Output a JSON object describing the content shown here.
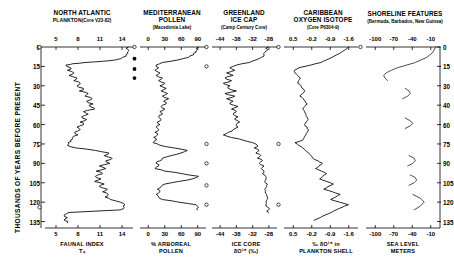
{
  "figure": {
    "yaxis": {
      "label": "THOUSANDS OF YEARS BEFORE PRESENT",
      "ticks": [
        0,
        15,
        30,
        45,
        60,
        75,
        90,
        105,
        120,
        135
      ],
      "right_ticks": [
        0,
        15,
        30,
        40,
        60,
        75,
        90,
        105,
        120,
        135
      ],
      "min": 0,
      "max": 140
    },
    "panels": [
      {
        "title": "NORTH ATLANTIC",
        "title2": "PLANKTON",
        "source": "(Core V23-82)",
        "xticks": [
          "5",
          "8",
          "11",
          "14"
        ],
        "xlabel1": "FAUNAL INDEX",
        "xlabel2": "Tₛ",
        "xmin": 4.2,
        "xmax": 15.2
      },
      {
        "title": "MEDITERRANEAN",
        "title2": "POLLEN",
        "source": "(Macedonia Lake)",
        "xticks": [
          "0",
          "30",
          "60",
          "90"
        ],
        "xlabel1": "% ARBOREAL",
        "xlabel2": "POLLEN",
        "xmin": -6,
        "xmax": 100
      },
      {
        "title": "GREENLAND",
        "title2": "ICE CAP",
        "source": "(Camp Century Core)",
        "xticks": [
          "-44",
          "-38",
          "-32",
          "-28"
        ],
        "xlabel1": "ICE CORE",
        "xlabel2": "δO¹⁸ (‰)",
        "xmin": -46,
        "xmax": -26
      },
      {
        "title": "CARIBBEAN",
        "title2": "OXYGEN ISOTOPE",
        "source": "(Core P6304-9)",
        "xticks": [
          "0.5",
          "-0.2",
          "-0.9",
          "-1.6"
        ],
        "xlabel1": "‰ δO¹⁸ in",
        "xlabel2": "PLANKTON SHELL",
        "xmin": 0.8,
        "xmax": -1.9
      },
      {
        "title": "SHORELINE FEATURES",
        "title2": "",
        "source": "(Bermuda, Barbados, New Guinea)",
        "xticks": [
          "-100",
          "-70",
          "-40",
          "-10"
        ],
        "xlabel1": "SEA LEVEL",
        "xlabel2": "METERS",
        "xmin": -112,
        "xmax": 5
      }
    ]
  },
  "chart_data": {
    "type": "line",
    "ylabel": "THOUSANDS OF YEARS BEFORE PRESENT",
    "ylim": [
      0,
      140
    ],
    "grid": false,
    "legend": "none",
    "series": [
      {
        "name": "North Atlantic Plankton Faunal Index Ts (Core V23-82)",
        "xlabel": "FAUNAL INDEX Ts",
        "xlim": [
          4.2,
          15.2
        ],
        "xticks": [
          5,
          8,
          11,
          14
        ],
        "age_kyr": [
          0,
          2,
          4,
          6,
          8,
          10,
          11,
          12,
          13,
          14,
          16,
          18,
          20,
          22,
          24,
          26,
          28,
          30,
          32,
          34,
          36,
          38,
          40,
          42,
          44,
          46,
          48,
          50,
          52,
          54,
          56,
          58,
          60,
          62,
          64,
          66,
          68,
          70,
          72,
          74,
          76,
          78,
          80,
          82,
          84,
          86,
          88,
          90,
          92,
          94,
          96,
          98,
          100,
          102,
          104,
          106,
          108,
          110,
          112,
          114,
          116,
          118,
          120,
          122,
          124,
          126,
          128,
          130,
          132,
          134,
          136
        ],
        "values": [
          14.6,
          14.6,
          14.5,
          14.3,
          13.9,
          13.0,
          11.5,
          9.2,
          7.6,
          6.8,
          7.4,
          7.0,
          7.8,
          7.2,
          8.2,
          7.8,
          8.6,
          8.2,
          9.0,
          8.5,
          9.6,
          9.2,
          10.1,
          9.4,
          10.2,
          9.8,
          10.4,
          9.0,
          9.6,
          8.8,
          9.4,
          8.6,
          9.0,
          8.2,
          8.6,
          7.9,
          8.3,
          7.6,
          7.4,
          7.1,
          7.0,
          8.0,
          10.5,
          12.2,
          11.6,
          12.6,
          11.8,
          12.3,
          11.0,
          11.8,
          10.6,
          11.4,
          10.5,
          11.2,
          10.4,
          11.6,
          11.0,
          12.0,
          11.4,
          12.1,
          11.7,
          12.4,
          13.6,
          14.2,
          14.1,
          13.6,
          7.2,
          6.6,
          7.0,
          6.6,
          7.0
        ]
      },
      {
        "name": "Mediterranean Arboreal Pollen (Macedonia Lake)",
        "xlabel": "% ARBOREAL POLLEN",
        "xlim": [
          -6,
          100
        ],
        "xticks": [
          0,
          30,
          60,
          90
        ],
        "age_kyr": [
          0,
          2,
          4,
          6,
          8,
          10,
          12,
          14,
          16,
          18,
          20,
          22,
          24,
          26,
          28,
          30,
          32,
          34,
          36,
          38,
          40,
          42,
          44,
          46,
          48,
          50,
          52,
          54,
          56,
          58,
          60,
          62,
          64,
          66,
          68,
          70,
          72,
          74,
          76,
          78,
          80,
          82,
          84,
          86,
          88,
          90,
          92,
          94,
          96,
          98,
          100,
          102,
          104,
          106,
          108,
          110,
          112,
          114,
          116,
          118,
          120,
          122,
          124,
          126
        ],
        "values": [
          88,
          86,
          84,
          80,
          72,
          55,
          30,
          20,
          24,
          18,
          26,
          20,
          30,
          24,
          34,
          26,
          36,
          28,
          38,
          30,
          40,
          32,
          36,
          28,
          34,
          26,
          30,
          24,
          28,
          22,
          26,
          20,
          24,
          18,
          22,
          16,
          20,
          15,
          26,
          48,
          70,
          60,
          44,
          30,
          26,
          20,
          24,
          18,
          34,
          62,
          88,
          78,
          56,
          34,
          28,
          22,
          26,
          20,
          24,
          30,
          56,
          84,
          88,
          86
        ]
      },
      {
        "name": "Greenland Ice Cap Oxygen Isotope (Camp Century Core)",
        "xlabel": "ICE CORE δO18 (‰)",
        "xlim": [
          -46,
          -26
        ],
        "xticks": [
          -44,
          -38,
          -32,
          -28
        ],
        "age_kyr": [
          0,
          3,
          6,
          9,
          12,
          14,
          16,
          18,
          20,
          22,
          24,
          26,
          28,
          30,
          32,
          34,
          36,
          38,
          40,
          42,
          44,
          46,
          48,
          50,
          52,
          54,
          56,
          58,
          60,
          62,
          64,
          66,
          68,
          70,
          72,
          74,
          76,
          78,
          80,
          82,
          84,
          86,
          88,
          90,
          92,
          94,
          96,
          98,
          100,
          104,
          108,
          112,
          116,
          120,
          124,
          128
        ],
        "values": [
          -28.8,
          -29.2,
          -30.0,
          -31.5,
          -34.5,
          -38.5,
          -40.5,
          -39.0,
          -41.5,
          -39.5,
          -42.0,
          -40.0,
          -42.5,
          -40.5,
          -41.0,
          -38.5,
          -42.0,
          -39.0,
          -41.5,
          -39.5,
          -40.5,
          -38.0,
          -40.0,
          -38.5,
          -39.5,
          -38.0,
          -39.0,
          -37.5,
          -38.5,
          -38.0,
          -39.5,
          -41.0,
          -42.5,
          -40.0,
          -36.5,
          -33.5,
          -32.0,
          -33.0,
          -31.5,
          -32.5,
          -31.0,
          -32.0,
          -30.5,
          -31.5,
          -30.0,
          -30.8,
          -30.0,
          -30.5,
          -29.5,
          -29.8,
          -29.2,
          -29.6,
          -29.0,
          -29.4,
          -28.8,
          -28.6
        ]
      },
      {
        "name": "Caribbean Oxygen Isotope in Plankton Shell (Core P6304-9)",
        "xlabel": "‰ δO18 in PLANKTON SHELL",
        "xlim": [
          0.8,
          -1.9
        ],
        "xticks": [
          0.5,
          -0.2,
          -0.9,
          -1.6
        ],
        "age_kyr": [
          0,
          4,
          8,
          12,
          16,
          18,
          20,
          24,
          28,
          30,
          34,
          38,
          40,
          44,
          48,
          52,
          56,
          60,
          64,
          68,
          72,
          74,
          78,
          82,
          86,
          90,
          94,
          98,
          102,
          106,
          110,
          114,
          118,
          122,
          126,
          130,
          134
        ],
        "values": [
          -1.55,
          -1.3,
          -0.95,
          -0.55,
          0.25,
          0.42,
          0.4,
          0.2,
          0.3,
          0.18,
          0.05,
          0.22,
          0.1,
          -0.05,
          0.12,
          0.0,
          -0.08,
          0.05,
          -0.1,
          0.0,
          0.12,
          0.4,
          0.12,
          -0.1,
          -0.25,
          -0.6,
          -0.35,
          -0.75,
          -0.5,
          -1.0,
          -0.65,
          -1.25,
          -0.9,
          -1.55,
          -1.1,
          -0.7,
          -0.3
        ]
      },
      {
        "name": "Shoreline Features Sea Level (Bermuda, Barbados, New Guinea)",
        "xlabel": "SEA LEVEL METERS",
        "xlim": [
          -112,
          5
        ],
        "xticks": [
          -100,
          -70,
          -40,
          -10
        ],
        "segments": [
          {
            "age_kyr": [
              0,
              4,
              8,
              12,
              14,
              16,
              18,
              20,
              22,
              24,
              26
            ],
            "values": [
              -2,
              -6,
              -16,
              -34,
              -48,
              -62,
              -72,
              -80,
              -84,
              -82,
              -78
            ]
          },
          {
            "age_kyr": [
              32,
              34,
              36,
              38,
              40
            ],
            "values": [
              -50,
              -44,
              -42,
              -46,
              -54
            ]
          },
          {
            "age_kyr": [
              55,
              57,
              59,
              61,
              63
            ],
            "values": [
              -50,
              -42,
              -38,
              -42,
              -50
            ]
          },
          {
            "age_kyr": [
              84,
              86,
              88,
              90,
              92
            ],
            "values": [
              -44,
              -36,
              -34,
              -38,
              -46
            ]
          },
          {
            "age_kyr": [
              99,
              101,
              103,
              105,
              107
            ],
            "values": [
              -42,
              -34,
              -32,
              -36,
              -44
            ]
          },
          {
            "age_kyr": [
              114,
              117,
              120,
              123,
              126
            ],
            "values": [
              -38,
              -26,
              -20,
              -26,
              -36
            ]
          }
        ]
      }
    ],
    "markers": {
      "open_circles": [
        {
          "panel": 1,
          "age_kyr": 0
        },
        {
          "panel": 1,
          "age_kyr": 75
        },
        {
          "panel": 1,
          "age_kyr": 124
        },
        {
          "panel": 2,
          "age_kyr": 0
        },
        {
          "panel": 3,
          "age_kyr": 0
        },
        {
          "panel": 3,
          "age_kyr": 15
        },
        {
          "panel": 3,
          "age_kyr": 75
        },
        {
          "panel": 3,
          "age_kyr": 90
        },
        {
          "panel": 3,
          "age_kyr": 107
        },
        {
          "panel": 3,
          "age_kyr": 122
        },
        {
          "panel": 4,
          "age_kyr": 0
        },
        {
          "panel": 4,
          "age_kyr": 75
        },
        {
          "panel": 4,
          "age_kyr": 122
        },
        {
          "panel": 5,
          "age_kyr": 0
        }
      ],
      "filled_circles": [
        {
          "panel": 2,
          "age_kyr": 9
        },
        {
          "panel": 2,
          "age_kyr": 17
        },
        {
          "panel": 2,
          "age_kyr": 24
        }
      ]
    }
  }
}
